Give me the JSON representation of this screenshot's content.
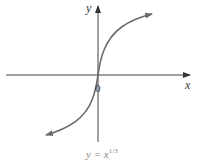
{
  "figure": {
    "x_axis_label": "x",
    "y_axis_label": "y",
    "origin_label": "0",
    "caption_base": "y = x",
    "caption_exponent": "1/3",
    "curve_color": "#6b6b6b",
    "axis_color": "#444444"
  }
}
